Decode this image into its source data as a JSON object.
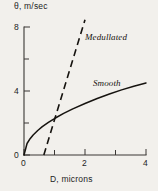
{
  "chart_data": {
    "type": "line",
    "title": "",
    "subtitle": "",
    "xlabel": "D, microns",
    "ylabel": "θ, m/sec",
    "xlim": [
      0,
      4
    ],
    "ylim": [
      0,
      8
    ],
    "xticks": [
      0,
      2,
      4
    ],
    "xticklabels": [
      "0",
      "2",
      "4"
    ],
    "xminorticks": [
      1,
      3
    ],
    "yticks": [
      0,
      4,
      8
    ],
    "yticklabels": [
      "0",
      "4",
      "8"
    ],
    "yminorticks": [
      2,
      6
    ],
    "grid": false,
    "legend_position": "inline-annotations",
    "series": [
      {
        "name": "Smooth",
        "style": "solid",
        "annotation": "Smooth",
        "x": [
          0.0,
          0.1,
          0.2,
          0.3,
          0.45,
          0.6,
          0.8,
          1.0,
          1.3,
          1.6,
          2.0,
          2.4,
          2.8,
          3.2,
          3.6,
          4.0
        ],
        "y": [
          0.0,
          0.72,
          1.02,
          1.25,
          1.53,
          1.77,
          2.04,
          2.28,
          2.6,
          2.88,
          3.22,
          3.53,
          3.81,
          4.07,
          4.3,
          4.5
        ]
      },
      {
        "name": "Medullated",
        "style": "dashed",
        "annotation": "Medullated",
        "x": [
          0.65,
          1.0,
          1.4,
          1.8,
          2.0
        ],
        "y": [
          0.0,
          2.2,
          4.7,
          7.2,
          8.45
        ]
      }
    ]
  },
  "annotations": {
    "medullated": "Medullated",
    "smooth": "Smooth"
  },
  "axes": {
    "x_title": "D, microns",
    "y_title": "θ, m/sec",
    "x_tick_0": "0",
    "x_tick_2": "2",
    "x_tick_4": "4",
    "y_tick_0": "0",
    "y_tick_4": "4",
    "y_tick_8": "8"
  },
  "colors": {
    "background": "#f2f0ec",
    "ink": "#16130f",
    "axis": "#3a3734"
  }
}
